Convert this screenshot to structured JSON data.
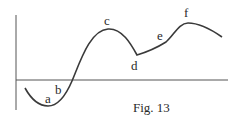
{
  "figure": {
    "caption": "Fig. 13",
    "colors": {
      "line": "#3a3a3a",
      "axis": "#555555",
      "background": "#ffffff"
    }
  },
  "axes": {
    "y_axis": {
      "x": 16,
      "y1": 15,
      "y2": 110
    },
    "x_axis": {
      "y": 80,
      "x1": 16,
      "x2": 228
    }
  },
  "curve": {
    "path": "M 25 88 C 30 97, 38 106, 48 106 C 58 106, 66 95, 72 81 C 80 62, 90 30, 108 29 C 122 28, 131 44, 137 55 C 147 52, 158 47, 166 42 C 174 35, 179 23, 188 23 C 198 23, 212 30, 222 37"
  },
  "points": [
    {
      "label": "a",
      "x": 45,
      "y": 103
    },
    {
      "label": "b",
      "x": 55,
      "y": 94
    },
    {
      "label": "c",
      "x": 104,
      "y": 25
    },
    {
      "label": "d",
      "x": 131,
      "y": 70
    },
    {
      "label": "e",
      "x": 157,
      "y": 40
    },
    {
      "label": "f",
      "x": 184,
      "y": 17
    }
  ]
}
